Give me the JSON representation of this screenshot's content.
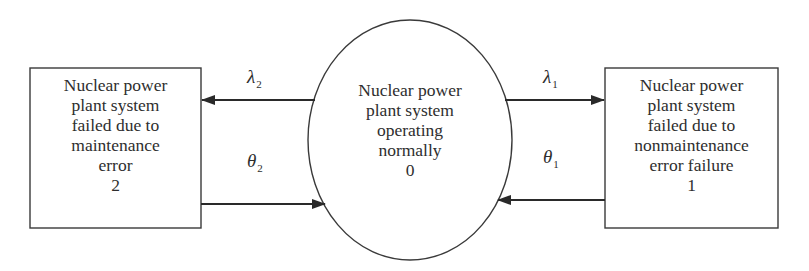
{
  "diagram": {
    "type": "state-transition (Markov) diagram",
    "nodes": [
      {
        "id": "state-2",
        "shape": "rectangle",
        "lines": [
          "Nuclear power",
          "plant system",
          "failed due to",
          "maintenance",
          "error",
          "2"
        ]
      },
      {
        "id": "state-0",
        "shape": "ellipse",
        "lines": [
          "Nuclear power",
          "plant system",
          "operating",
          "normally",
          "0"
        ]
      },
      {
        "id": "state-1",
        "shape": "rectangle",
        "lines": [
          "Nuclear power",
          "plant system",
          "failed due to",
          "nonmaintenance",
          "error failure",
          "1"
        ]
      }
    ],
    "edges": [
      {
        "from": "state-0",
        "to": "state-2",
        "symbol": "λ",
        "subscript": "2"
      },
      {
        "from": "state-2",
        "to": "state-0",
        "symbol": "θ",
        "subscript": "2"
      },
      {
        "from": "state-0",
        "to": "state-1",
        "symbol": "λ",
        "subscript": "1"
      },
      {
        "from": "state-1",
        "to": "state-0",
        "symbol": "θ",
        "subscript": "1"
      }
    ]
  },
  "colors": {
    "stroke": "#3a3a3a",
    "text": "#2e2e2e",
    "background": "#ffffff"
  }
}
